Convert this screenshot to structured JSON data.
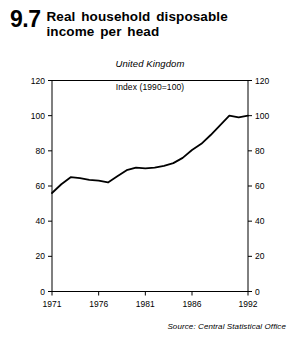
{
  "header": {
    "figure_number": "9.7",
    "title": "Real  household  disposable income per head"
  },
  "source": {
    "text": "Source: Central Statistical Office"
  },
  "chart_data": {
    "type": "line",
    "title": "Real household disposable income per head",
    "subtitle": "United Kingdom",
    "annotation": "Index (1990=100)",
    "xlabel": "",
    "ylabel": "",
    "ylim": [
      0,
      120
    ],
    "xlim": [
      1971,
      1992
    ],
    "grid": false,
    "legend": false,
    "y_ticks": [
      0,
      20,
      40,
      60,
      80,
      100,
      120
    ],
    "y_ticks_right": [
      0,
      20,
      40,
      60,
      80,
      100,
      120
    ],
    "x_ticks": [
      1971,
      1976,
      1981,
      1986,
      1992
    ],
    "x_tick_labels": [
      "1971",
      "1976",
      "1981",
      "1986",
      "1992"
    ],
    "line_color": "#000000",
    "x": [
      1971,
      1972,
      1973,
      1974,
      1975,
      1976,
      1977,
      1978,
      1979,
      1980,
      1981,
      1982,
      1983,
      1984,
      1985,
      1986,
      1987,
      1988,
      1989,
      1990,
      1991,
      1992
    ],
    "values": [
      56,
      61,
      65,
      64.5,
      63.5,
      63,
      62,
      65.5,
      69,
      70.5,
      70,
      70.5,
      71.5,
      73,
      76,
      80.5,
      84,
      89,
      94.5,
      100,
      99,
      100
    ],
    "series": [
      {
        "name": "Real household disposable income per head",
        "values": [
          56,
          61,
          65,
          64.5,
          63.5,
          63,
          62,
          65.5,
          69,
          70.5,
          70,
          70.5,
          71.5,
          73,
          76,
          80.5,
          84,
          89,
          94.5,
          100,
          99,
          100
        ]
      }
    ]
  }
}
